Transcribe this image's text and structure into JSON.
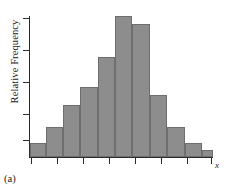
{
  "figure": {
    "panel_label": "(a)",
    "x_axis_variable": "x",
    "y_axis_label": "Relative Frequency",
    "bar_fill_color": "#8d8d8d",
    "bar_edge_color": "#6e6e6e",
    "axis_color": "#2b2b2b",
    "background_color": "#ffffff"
  },
  "chart_data": {
    "type": "bar",
    "title": "",
    "subtitle": "",
    "xlabel": "x",
    "ylabel": "Relative Frequency",
    "annotations": [
      "(a)"
    ],
    "legend": [],
    "legend_position": "none",
    "grid": false,
    "xlim": [
      0,
      11
    ],
    "ylim": [
      0,
      1
    ],
    "x_tick_labels": [],
    "y_tick_labels": [],
    "n_x_ticks": 8,
    "n_y_ticks": 5,
    "categories": [
      "1",
      "2",
      "3",
      "4",
      "5",
      "6",
      "7",
      "8",
      "9",
      "10",
      "11"
    ],
    "values": [
      0.1,
      0.21,
      0.37,
      0.5,
      0.71,
      1.0,
      0.94,
      0.44,
      0.21,
      0.1,
      0.05
    ],
    "bars": [
      {
        "index": 0,
        "left_pct": 0.0,
        "width_pct": 8.5,
        "height_pct": 10
      },
      {
        "index": 1,
        "left_pct": 8.5,
        "width_pct": 9.5,
        "height_pct": 21
      },
      {
        "index": 2,
        "left_pct": 18.0,
        "width_pct": 9.5,
        "height_pct": 37
      },
      {
        "index": 3,
        "left_pct": 27.5,
        "width_pct": 9.5,
        "height_pct": 50
      },
      {
        "index": 4,
        "left_pct": 37.0,
        "width_pct": 9.5,
        "height_pct": 71
      },
      {
        "index": 5,
        "left_pct": 46.5,
        "width_pct": 9.5,
        "height_pct": 100
      },
      {
        "index": 6,
        "left_pct": 56.0,
        "width_pct": 9.5,
        "height_pct": 94
      },
      {
        "index": 7,
        "left_pct": 65.5,
        "width_pct": 9.5,
        "height_pct": 44
      },
      {
        "index": 8,
        "left_pct": 75.0,
        "width_pct": 9.5,
        "height_pct": 21
      },
      {
        "index": 9,
        "left_pct": 84.5,
        "width_pct": 9.5,
        "height_pct": 10
      },
      {
        "index": 10,
        "left_pct": 94.0,
        "width_pct": 6.0,
        "height_pct": 5
      }
    ],
    "y_ticks_px": [
      18,
      50,
      82,
      114,
      140
    ],
    "x_ticks_px": [
      31,
      57,
      83,
      109,
      135,
      161,
      187,
      211
    ]
  }
}
